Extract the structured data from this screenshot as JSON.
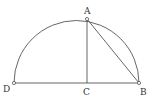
{
  "diagram": {
    "type": "geometry",
    "stroke_color": "#555555",
    "points": {
      "A": {
        "label": "A",
        "x": 87,
        "y": 19
      },
      "B": {
        "label": "B",
        "x": 139,
        "y": 83
      },
      "C": {
        "label": "C",
        "x": 87,
        "y": 83
      },
      "D": {
        "label": "D",
        "x": 14,
        "y": 83
      }
    },
    "segments": [
      {
        "from": "D",
        "to": "B"
      },
      {
        "from": "A",
        "to": "C"
      },
      {
        "from": "A",
        "to": "B"
      }
    ],
    "arc": {
      "from": "D",
      "to": "B",
      "shape": "semicircle"
    }
  }
}
